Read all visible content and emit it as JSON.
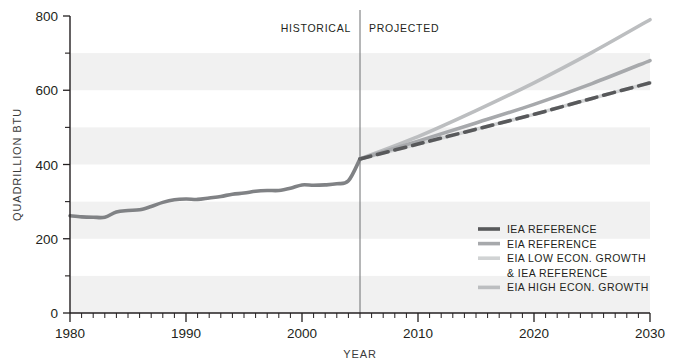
{
  "chart_data": {
    "type": "line",
    "title": "",
    "xlabel": "YEAR",
    "ylabel": "QUADRILLION BTU",
    "xlim": [
      1980,
      2030
    ],
    "ylim": [
      0,
      800
    ],
    "xticks": [
      1980,
      1990,
      2000,
      2010,
      2020,
      2030
    ],
    "xtick_labels": [
      "1980",
      "1990",
      "2000",
      "2010",
      "2020",
      "2030"
    ],
    "x_minor_tick_step": 1,
    "yticks": [
      0,
      200,
      400,
      600,
      800
    ],
    "ytick_labels": [
      "0",
      "200",
      "400",
      "600",
      "800"
    ],
    "y_minor_ticks": [
      100,
      300,
      500,
      700
    ],
    "grid": false,
    "banding": {
      "enabled": true,
      "band_step": 100,
      "band_color": "#f1f1f1",
      "note": "alternating horizontal shaded bands every 100 units"
    },
    "legend_position": "inside-lower-right",
    "divider": {
      "x": 2005,
      "left_label": "HISTORICAL",
      "right_label": "PROJECTED",
      "color": "#6d6e71"
    },
    "series": [
      {
        "name": "HISTORICAL",
        "color": "#808285",
        "style": "solid",
        "width": 3.6,
        "in_legend": false,
        "x": [
          1980,
          1981,
          1982,
          1983,
          1984,
          1985,
          1986,
          1987,
          1988,
          1989,
          1990,
          1991,
          1992,
          1993,
          1994,
          1995,
          1996,
          1997,
          1998,
          1999,
          2000,
          2001,
          2002,
          2003,
          2004,
          2005
        ],
        "y": [
          262,
          259,
          258,
          258,
          272,
          276,
          278,
          287,
          298,
          305,
          307,
          306,
          310,
          314,
          320,
          323,
          328,
          330,
          330,
          336,
          345,
          344,
          345,
          348,
          356,
          415
        ]
      },
      {
        "name": "IEA REFERENCE",
        "color": "#58595b",
        "style": "dashed",
        "width": 3.6,
        "in_legend": true,
        "x": [
          2005,
          2010,
          2015,
          2020,
          2025,
          2030
        ],
        "y": [
          415,
          455,
          495,
          535,
          578,
          620
        ]
      },
      {
        "name": "EIA REFERENCE",
        "color": "#a7a9ac",
        "style": "solid",
        "width": 3.6,
        "in_legend": true,
        "x": [
          2005,
          2010,
          2015,
          2020,
          2025,
          2030
        ],
        "y": [
          415,
          463,
          512,
          562,
          618,
          680
        ]
      },
      {
        "name": "EIA LOW ECON. GROWTH & IEA REFERENCE",
        "color": "#d1d3d4",
        "style": "solid",
        "width": 3.6,
        "in_legend": true,
        "x": [
          2005,
          2010,
          2015,
          2020,
          2025,
          2030
        ],
        "y": [
          415,
          455,
          495,
          535,
          578,
          620
        ]
      },
      {
        "name": "EIA HIGH ECON. GROWTH",
        "color": "#bcbec0",
        "style": "solid",
        "width": 3.6,
        "in_legend": true,
        "x": [
          2005,
          2010,
          2015,
          2020,
          2025,
          2030
        ],
        "y": [
          415,
          475,
          545,
          620,
          702,
          790
        ]
      }
    ],
    "legend": [
      {
        "label": "IEA REFERENCE",
        "color": "#58595b"
      },
      {
        "label": "EIA REFERENCE",
        "color": "#a7a9ac"
      },
      {
        "label": "EIA LOW ECON. GROWTH",
        "color": "#d1d3d4"
      },
      {
        "label": "& IEA REFERENCE",
        "color": null
      },
      {
        "label": "EIA HIGH ECON. GROWTH",
        "color": "#bcbec0"
      }
    ]
  },
  "axes": {
    "y_title": "QUADRILLION BTU",
    "x_title": "YEAR",
    "y_labels": {
      "t0": "0",
      "t200": "200",
      "t400": "400",
      "t600": "600",
      "t800": "800"
    },
    "x_labels": {
      "t1980": "1980",
      "t1990": "1990",
      "t2000": "2000",
      "t2010": "2010",
      "t2020": "2020",
      "t2030": "2030"
    },
    "axis_color": "#231f20"
  },
  "era": {
    "historical": "HISTORICAL",
    "projected": "PROJECTED"
  },
  "legend": {
    "item0": "IEA REFERENCE",
    "item1": "EIA REFERENCE",
    "item2": "EIA LOW ECON. GROWTH",
    "item3": "& IEA REFERENCE",
    "item4": "EIA HIGH ECON. GROWTH"
  },
  "colors": {
    "iea_reference": "#58595b",
    "eia_reference": "#a7a9ac",
    "eia_low": "#d1d3d4",
    "eia_high": "#bcbec0",
    "historical": "#808285",
    "band": "#f1f1f1",
    "axis": "#231f20"
  }
}
